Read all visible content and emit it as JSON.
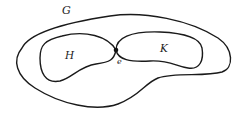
{
  "diagram": {
    "type": "set-diagram",
    "labels": {
      "outer": "G",
      "left_region": "H",
      "right_region": "K",
      "point": "e"
    },
    "colors": {
      "stroke": "#1a1a1a",
      "text": "#222222",
      "background": "#ffffff"
    }
  }
}
